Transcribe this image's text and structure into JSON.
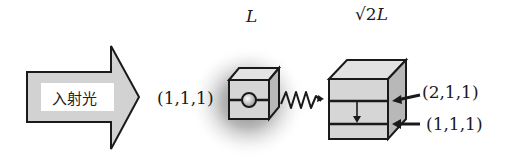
{
  "diagram": {
    "incident_arrow": {
      "label": "入射光"
    },
    "small_box": {
      "size_label": "L",
      "state_label": "(1,1,1)"
    },
    "large_box": {
      "size_label_prefix": "√2",
      "size_label_suffix": "L",
      "upper_level_label": "(2,1,1)",
      "lower_level_label": "(1,1,1)"
    },
    "colors": {
      "box_fill": "#d6d6d6",
      "box_side": "#b8b8b8",
      "box_top": "#e2e2e2",
      "stroke": "#1a1a1a",
      "glow": "#8a8a8a"
    }
  }
}
